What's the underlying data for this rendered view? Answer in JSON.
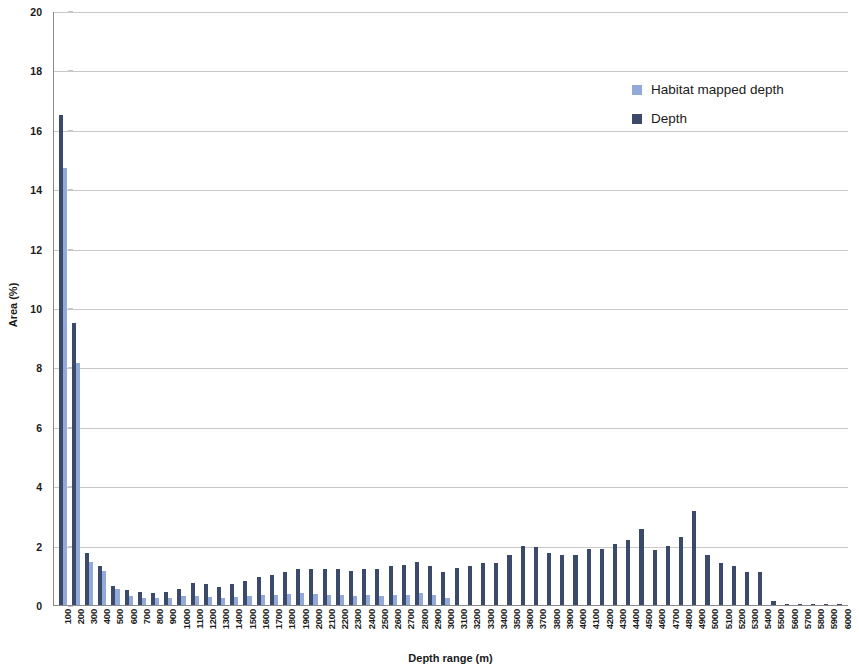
{
  "chart_data": {
    "type": "bar",
    "title": "",
    "xlabel": "Depth range (m)",
    "ylabel": "Area (%)",
    "ylim": [
      0,
      20
    ],
    "ytick_step": 2,
    "yticks": [
      0,
      2,
      4,
      6,
      8,
      10,
      12,
      14,
      16,
      18,
      20
    ],
    "grid": true,
    "legend_position": "top-right",
    "categories": [
      "100",
      "200",
      "300",
      "400",
      "500",
      "600",
      "700",
      "800",
      "900",
      "1000",
      "1100",
      "1200",
      "1300",
      "1400",
      "1500",
      "1600",
      "1700",
      "1800",
      "1900",
      "2000",
      "2100",
      "2200",
      "2300",
      "2400",
      "2500",
      "2600",
      "2700",
      "2800",
      "2900",
      "3000",
      "3100",
      "3200",
      "3300",
      "3400",
      "3500",
      "3600",
      "3700",
      "3800",
      "3900",
      "4000",
      "4100",
      "4200",
      "4300",
      "4400",
      "4500",
      "4600",
      "4700",
      "4800",
      "4900",
      "5000",
      "5100",
      "5200",
      "5300",
      "5400",
      "5500",
      "5600",
      "5700",
      "5800",
      "5900",
      "6000"
    ],
    "series": [
      {
        "name": "Depth",
        "color": "#3b4a6b",
        "values": [
          16.5,
          9.5,
          1.75,
          1.3,
          0.65,
          0.5,
          0.45,
          0.42,
          0.45,
          0.55,
          0.75,
          0.7,
          0.62,
          0.7,
          0.8,
          0.95,
          1.0,
          1.1,
          1.2,
          1.2,
          1.2,
          1.2,
          1.15,
          1.2,
          1.2,
          1.3,
          1.35,
          1.45,
          1.3,
          1.1,
          1.25,
          1.3,
          1.4,
          1.4,
          1.7,
          2.0,
          1.95,
          1.75,
          1.7,
          1.7,
          1.9,
          1.9,
          2.05,
          2.2,
          2.55,
          1.85,
          2.0,
          2.3,
          3.15,
          1.7,
          1.4,
          1.3,
          1.1,
          1.1,
          0.15,
          0.05,
          0.04,
          0.03,
          0.03,
          0.02
        ]
      },
      {
        "name": "Habitat mapped depth",
        "color": "#93a9d8",
        "values": [
          14.7,
          8.15,
          1.45,
          1.15,
          0.55,
          0.3,
          0.25,
          0.22,
          0.25,
          0.3,
          0.3,
          0.28,
          0.25,
          0.28,
          0.3,
          0.35,
          0.35,
          0.38,
          0.4,
          0.38,
          0.35,
          0.35,
          0.32,
          0.35,
          0.32,
          0.35,
          0.35,
          0.4,
          0.35,
          0.25,
          0,
          0,
          0,
          0,
          0,
          0,
          0,
          0,
          0,
          0,
          0,
          0,
          0,
          0,
          0,
          0,
          0,
          0,
          0,
          0,
          0,
          0,
          0,
          0,
          0,
          0,
          0,
          0,
          0,
          0
        ]
      }
    ]
  },
  "legend": {
    "items": [
      {
        "label": "Habitat mapped depth",
        "color": "#93a9d8"
      },
      {
        "label": "Depth",
        "color": "#3b4a6b"
      }
    ]
  },
  "axes": {
    "y_title": "Area (%)",
    "x_title": "Depth range (m)"
  }
}
